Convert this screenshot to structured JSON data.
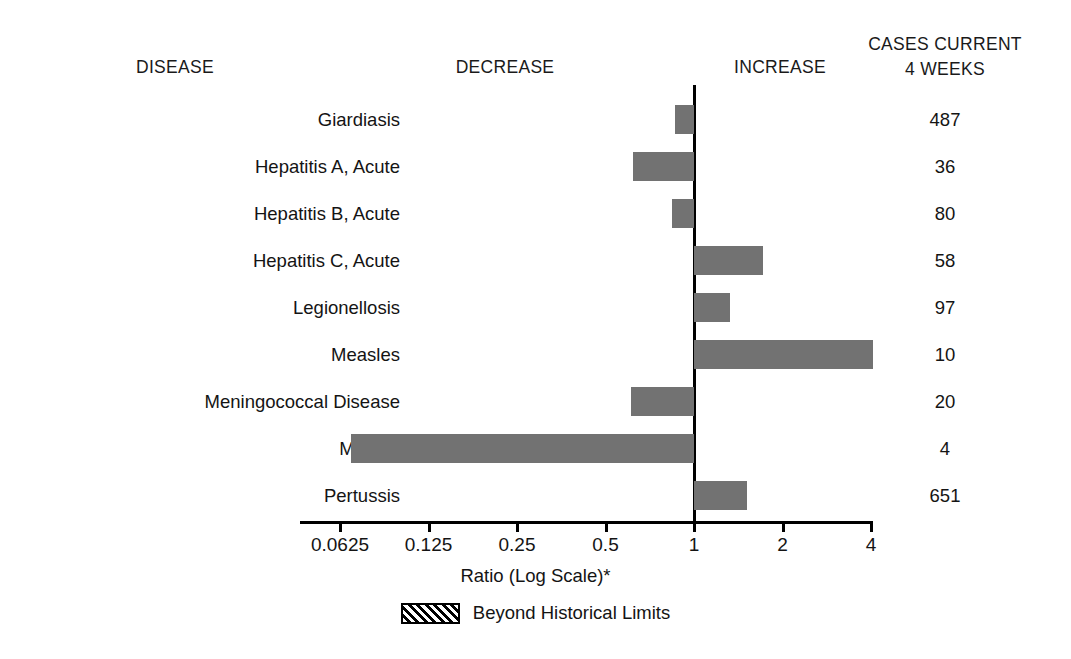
{
  "header": {
    "disease": "DISEASE",
    "decrease": "DECREASE",
    "increase": "INCREASE",
    "cases_line1": "CASES CURRENT",
    "cases_line2": "4 WEEKS"
  },
  "axis": {
    "title": "Ratio (Log Scale)*",
    "tick_labels": [
      "0.0625",
      "0.125",
      "0.25",
      "0.5",
      "1",
      "2",
      "4"
    ],
    "tick_values": [
      0.0625,
      0.125,
      0.25,
      0.5,
      1,
      2,
      4
    ]
  },
  "legend": {
    "label": "Beyond Historical Limits",
    "pattern": "diagonal-hatch"
  },
  "colors": {
    "bar_fill": "#727272",
    "axis": "#000000",
    "text": "#141414",
    "background": "#ffffff"
  },
  "chart_data": {
    "type": "bar",
    "orientation": "horizontal",
    "title": "",
    "xlabel": "Ratio (Log Scale)*",
    "ylabel": "DISEASE",
    "xscale": "log2",
    "xlim": [
      0.0625,
      4
    ],
    "reference_line": 1,
    "grid": false,
    "legend_position": "bottom-center",
    "categories": [
      "Giardiasis",
      "Hepatitis A, Acute",
      "Hepatitis B, Acute",
      "Hepatitis C, Acute",
      "Legionellosis",
      "Measles",
      "Meningococcal Disease",
      "Mumps",
      "Pertussis"
    ],
    "series": [
      {
        "name": "Ratio",
        "values": [
          0.86,
          0.62,
          0.84,
          1.72,
          1.33,
          4.06,
          0.61,
          0.068,
          1.52
        ]
      },
      {
        "name": "Cases Current 4 Weeks",
        "values": [
          487,
          36,
          80,
          58,
          97,
          10,
          20,
          4,
          651
        ]
      }
    ],
    "beyond_historical_limits": [
      false,
      false,
      false,
      false,
      false,
      false,
      false,
      false,
      false
    ]
  },
  "rows": [
    {
      "disease": "Giardiasis",
      "ratio": 0.86,
      "cases": "487",
      "beyond": false
    },
    {
      "disease": "Hepatitis A, Acute",
      "ratio": 0.62,
      "cases": "36",
      "beyond": false
    },
    {
      "disease": "Hepatitis B, Acute",
      "ratio": 0.84,
      "cases": "80",
      "beyond": false
    },
    {
      "disease": "Hepatitis C, Acute",
      "ratio": 1.72,
      "cases": "58",
      "beyond": false
    },
    {
      "disease": "Legionellosis",
      "ratio": 1.33,
      "cases": "97",
      "beyond": false
    },
    {
      "disease": "Measles",
      "ratio": 4.06,
      "cases": "10",
      "beyond": false
    },
    {
      "disease": "Meningococcal Disease",
      "ratio": 0.61,
      "cases": "20",
      "beyond": false
    },
    {
      "disease": "Mumps",
      "ratio": 0.068,
      "cases": "4",
      "beyond": false
    },
    {
      "disease": "Pertussis",
      "ratio": 1.52,
      "cases": "651",
      "beyond": false
    }
  ]
}
